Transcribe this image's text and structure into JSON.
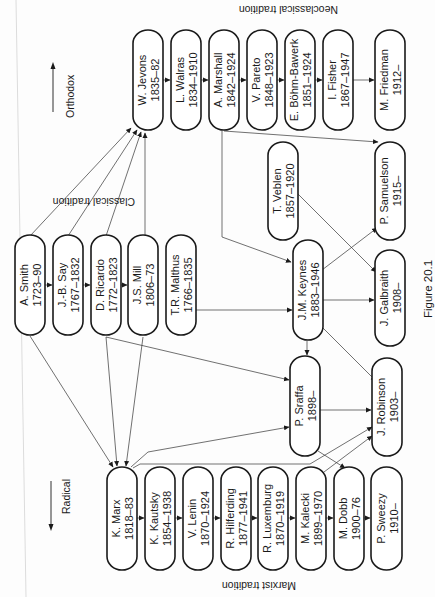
{
  "figure": {
    "caption": "Figure 20.1",
    "traditions": {
      "classical": "Classical tradition",
      "neoclassical": "Neoclassical tradition",
      "marxist": "Marxist tradition"
    },
    "axis": {
      "orthodox": "Orthodox",
      "radical": "Radical"
    }
  },
  "nodes": [
    {
      "id": "smith",
      "name": "A. Smith",
      "years": "1723–90",
      "x": 15,
      "y": 235,
      "w": 30,
      "h": 100
    },
    {
      "id": "say",
      "name": "J.-B. Say",
      "years": "1767–1832",
      "x": 53,
      "y": 235,
      "w": 30,
      "h": 100
    },
    {
      "id": "ricardo",
      "name": "D. Ricardo",
      "years": "1772–1823",
      "x": 91,
      "y": 235,
      "w": 30,
      "h": 100
    },
    {
      "id": "mill",
      "name": "J.S. Mill",
      "years": "1806–73",
      "x": 128,
      "y": 235,
      "w": 30,
      "h": 100
    },
    {
      "id": "malthus",
      "name": "T.R. Malthus",
      "years": "1766–1835",
      "x": 166,
      "y": 235,
      "w": 30,
      "h": 100
    },
    {
      "id": "jevons",
      "name": "W. Jevons",
      "years": "1835–82",
      "x": 133,
      "y": 30,
      "w": 30,
      "h": 100
    },
    {
      "id": "walras",
      "name": "L. Walras",
      "years": "1834–1910",
      "x": 171,
      "y": 30,
      "w": 30,
      "h": 100
    },
    {
      "id": "marshall",
      "name": "A. Marshall",
      "years": "1842–1924",
      "x": 209,
      "y": 30,
      "w": 30,
      "h": 100
    },
    {
      "id": "pareto",
      "name": "V. Pareto",
      "years": "1848–1923",
      "x": 247,
      "y": 30,
      "w": 30,
      "h": 100
    },
    {
      "id": "bohm",
      "name": "E. Böhm-Bawerk",
      "years": "1851–1924",
      "x": 285,
      "y": 30,
      "w": 30,
      "h": 100
    },
    {
      "id": "fisher",
      "name": "I. Fisher",
      "years": "1867–1947",
      "x": 323,
      "y": 30,
      "w": 30,
      "h": 100
    },
    {
      "id": "friedman",
      "name": "M. Friedman",
      "years": "1912–",
      "x": 375,
      "y": 30,
      "w": 30,
      "h": 100
    },
    {
      "id": "veblen",
      "name": "T. Veblen",
      "years": "1857–1920",
      "x": 268,
      "y": 142,
      "w": 30,
      "h": 98
    },
    {
      "id": "samuelson",
      "name": "P. Samuelson",
      "years": "1915–",
      "x": 375,
      "y": 142,
      "w": 30,
      "h": 98
    },
    {
      "id": "keynes",
      "name": "J.M. Keynes",
      "years": "1883–1946",
      "x": 293,
      "y": 240,
      "w": 30,
      "h": 100
    },
    {
      "id": "galbraith",
      "name": "J. Galbraith",
      "years": "1908–",
      "x": 375,
      "y": 250,
      "w": 30,
      "h": 96
    },
    {
      "id": "sraffa",
      "name": "P. Sraffa",
      "years": "1898–",
      "x": 290,
      "y": 356,
      "w": 30,
      "h": 100
    },
    {
      "id": "robinson",
      "name": "J. Robinson",
      "years": "1903–",
      "x": 372,
      "y": 358,
      "w": 30,
      "h": 98
    },
    {
      "id": "marx",
      "name": "K. Marx",
      "years": "1818–83",
      "x": 107,
      "y": 467,
      "w": 30,
      "h": 103
    },
    {
      "id": "kautsky",
      "name": "K. Kautsky",
      "years": "1854–1938",
      "x": 145,
      "y": 467,
      "w": 30,
      "h": 103
    },
    {
      "id": "lenin",
      "name": "V. Lenin",
      "years": "1870–1924",
      "x": 183,
      "y": 467,
      "w": 30,
      "h": 103
    },
    {
      "id": "hilferding",
      "name": "R. Hilferding",
      "years": "1877–1941",
      "x": 221,
      "y": 467,
      "w": 30,
      "h": 103
    },
    {
      "id": "luxemburg",
      "name": "R. Luxemburg",
      "years": "1870–1919",
      "x": 258,
      "y": 467,
      "w": 30,
      "h": 103
    },
    {
      "id": "kalecki",
      "name": "M. Kalecki",
      "years": "1899–1970",
      "x": 296,
      "y": 467,
      "w": 30,
      "h": 103
    },
    {
      "id": "dobb",
      "name": "M. Dobb",
      "years": "1900–76",
      "x": 334,
      "y": 467,
      "w": 30,
      "h": 103
    },
    {
      "id": "sweezy",
      "name": "P. Sweezy",
      "years": "1910–",
      "x": 371,
      "y": 467,
      "w": 31,
      "h": 103
    }
  ],
  "edges": [
    {
      "from": "smith",
      "to": "say"
    },
    {
      "from": "say",
      "to": "ricardo"
    },
    {
      "from": "ricardo",
      "to": "mill"
    },
    {
      "from": "smith",
      "to": "jevons"
    },
    {
      "from": "say",
      "to": "jevons"
    },
    {
      "from": "ricardo",
      "to": "jevons"
    },
    {
      "from": "mill",
      "to": "jevons"
    },
    {
      "from": "jevons",
      "to": "walras"
    },
    {
      "from": "walras",
      "to": "marshall"
    },
    {
      "from": "marshall",
      "to": "pareto"
    },
    {
      "from": "pareto",
      "to": "bohm"
    },
    {
      "from": "bohm",
      "to": "fisher"
    },
    {
      "from": "fisher",
      "to": "friedman"
    },
    {
      "from": "marshall",
      "to": "samuelson"
    },
    {
      "from": "marshall",
      "to": "keynes"
    },
    {
      "from": "malthus",
      "to": "keynes"
    },
    {
      "from": "veblen",
      "to": "galbraith"
    },
    {
      "from": "keynes",
      "to": "samuelson"
    },
    {
      "from": "keynes",
      "to": "galbraith"
    },
    {
      "from": "keynes",
      "to": "robinson"
    },
    {
      "from": "keynes",
      "to": "sraffa"
    },
    {
      "from": "ricardo",
      "to": "sraffa"
    },
    {
      "from": "marx",
      "to": "sraffa"
    },
    {
      "from": "sraffa",
      "to": "robinson"
    },
    {
      "from": "sraffa",
      "to": "dobb"
    },
    {
      "from": "marx",
      "to": "robinson"
    },
    {
      "from": "kalecki",
      "to": "robinson"
    },
    {
      "from": "smith",
      "to": "marx"
    },
    {
      "from": "ricardo",
      "to": "marx"
    },
    {
      "from": "mill",
      "to": "marx"
    },
    {
      "from": "marx",
      "to": "kautsky"
    },
    {
      "from": "kautsky",
      "to": "lenin"
    },
    {
      "from": "lenin",
      "to": "hilferding"
    },
    {
      "from": "hilferding",
      "to": "luxemburg"
    },
    {
      "from": "luxemburg",
      "to": "kalecki"
    },
    {
      "from": "kalecki",
      "to": "dobb"
    },
    {
      "from": "dobb",
      "to": "sweezy"
    }
  ]
}
